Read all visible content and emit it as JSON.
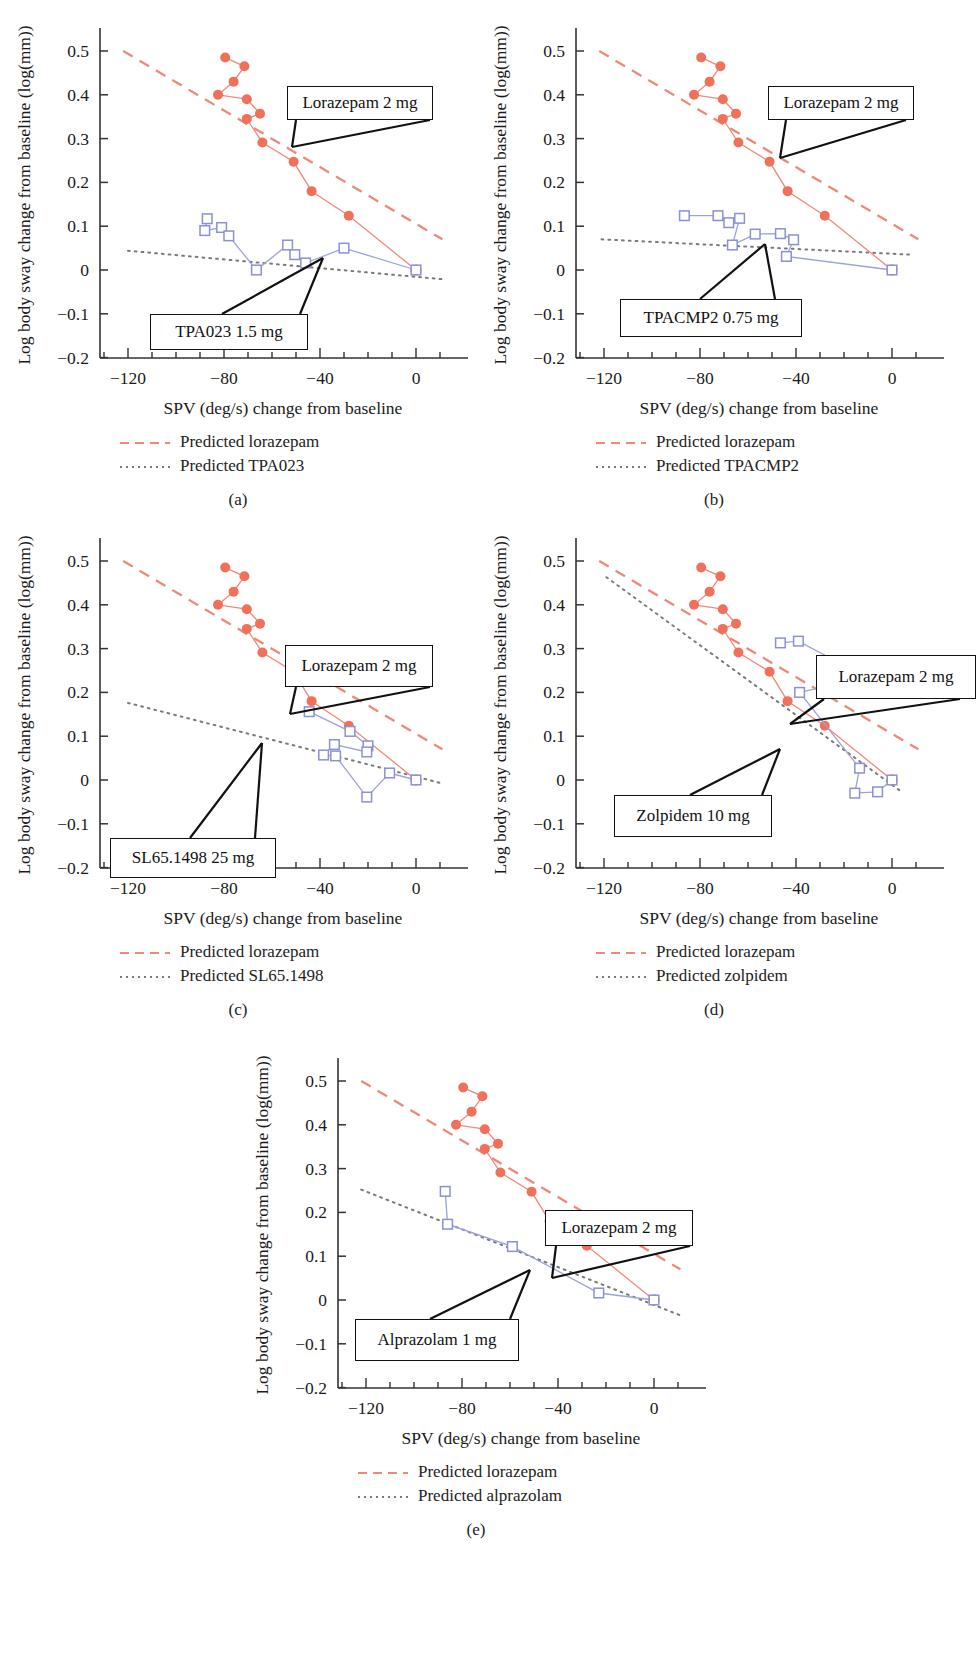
{
  "figure": {
    "x_axis_label": "SPV (deg/s) change from baseline",
    "y_axis_label": "Log body sway change from baseline (log(mm))",
    "x_ticks": [
      "−120",
      "−80",
      "−40",
      "0"
    ],
    "y_ticks": [
      "0.5",
      "0.4",
      "0.3",
      "0.2",
      "0.1",
      "0",
      "−0.1",
      "−0.2"
    ],
    "colors": {
      "lorazepam": "#F0705A",
      "comparator": "#8A92D0",
      "predicted_lorazepam": "#EE8878",
      "predicted_comparator": "#7A7A7A",
      "origin_marker": "#C9615C"
    }
  },
  "panels": [
    {
      "id": "a",
      "caption": "(a)",
      "annotations": [
        {
          "label": "Lorazepam 2 mg"
        },
        {
          "label": "TPA023 1.5 mg"
        }
      ],
      "legend": [
        {
          "style": "dashed",
          "label": "Predicted lorazepam"
        },
        {
          "style": "dotted",
          "label": "Predicted TPA023"
        }
      ]
    },
    {
      "id": "b",
      "caption": "(b)",
      "annotations": [
        {
          "label": "Lorazepam 2 mg"
        },
        {
          "label": "TPACMP2 0.75 mg"
        }
      ],
      "legend": [
        {
          "style": "dashed",
          "label": "Predicted lorazepam"
        },
        {
          "style": "dotted",
          "label": "Predicted TPACMP2"
        }
      ]
    },
    {
      "id": "c",
      "caption": "(c)",
      "annotations": [
        {
          "label": "Lorazepam 2 mg"
        },
        {
          "label": "SL65.1498 25 mg"
        }
      ],
      "legend": [
        {
          "style": "dashed",
          "label": "Predicted lorazepam"
        },
        {
          "style": "dotted",
          "label": "Predicted SL65.1498"
        }
      ]
    },
    {
      "id": "d",
      "caption": "(d)",
      "annotations": [
        {
          "label": "Lorazepam 2 mg"
        },
        {
          "label": "Zolpidem 10 mg"
        }
      ],
      "legend": [
        {
          "style": "dashed",
          "label": "Predicted lorazepam"
        },
        {
          "style": "dotted",
          "label": "Predicted zolpidem"
        }
      ]
    },
    {
      "id": "e",
      "caption": "(e)",
      "annotations": [
        {
          "label": "Lorazepam 2 mg"
        },
        {
          "label": "Alprazolam 1 mg"
        }
      ],
      "legend": [
        {
          "style": "dashed",
          "label": "Predicted lorazepam"
        },
        {
          "style": "dotted",
          "label": "Predicted alprazolam"
        }
      ]
    }
  ],
  "chart_data": [
    {
      "type": "scatter",
      "panel": "a",
      "title": "(a)",
      "xlabel": "SPV (deg/s) change from baseline",
      "ylabel": "Log body sway change from baseline (log(mm))",
      "xlim": [
        -135,
        15
      ],
      "ylim": [
        -0.23,
        0.53
      ],
      "grid": false,
      "legend_position": "below",
      "series": [
        {
          "name": "Lorazepam 2 mg",
          "marker": "filled-circle",
          "color": "#F0705A",
          "points": [
            [
              -79.5,
              0.485
            ],
            [
              -71.5,
              0.465
            ],
            [
              -76.0,
              0.43
            ],
            [
              -82.5,
              0.4
            ],
            [
              -70.5,
              0.39
            ],
            [
              -65.0,
              0.357
            ],
            [
              -70.5,
              0.345
            ],
            [
              -64.0,
              0.291
            ],
            [
              -51.0,
              0.247
            ],
            [
              -43.5,
              0.18
            ],
            [
              -28.0,
              0.124
            ],
            [
              0.0,
              0.0
            ]
          ]
        },
        {
          "name": "TPA023 1.5 mg",
          "marker": "open-square",
          "color": "#8A92D0",
          "points": [
            [
              -87.0,
              0.117
            ],
            [
              -88.0,
              0.09
            ],
            [
              -81.0,
              0.097
            ],
            [
              -78.0,
              0.078
            ],
            [
              -66.5,
              0.0
            ],
            [
              -53.5,
              0.057
            ],
            [
              -50.5,
              0.035
            ],
            [
              -46.0,
              0.016
            ],
            [
              -30.0,
              0.05
            ],
            [
              0.0,
              0.0
            ]
          ]
        },
        {
          "name": "Predicted lorazepam",
          "type": "line",
          "style": "dashed",
          "color": "#EE8878",
          "endpoints": [
            [
              -122.0,
              0.5
            ],
            [
              11.0,
              0.07
            ]
          ]
        },
        {
          "name": "Predicted TPA023",
          "type": "line",
          "style": "dotted",
          "color": "#7A7A7A",
          "endpoints": [
            [
              -120.0,
              0.044
            ],
            [
              11.0,
              -0.021
            ]
          ]
        }
      ]
    },
    {
      "type": "scatter",
      "panel": "b",
      "title": "(b)",
      "xlabel": "SPV (deg/s) change from baseline",
      "ylabel": "Log body sway change from baseline (log(mm))",
      "xlim": [
        -135,
        15
      ],
      "ylim": [
        -0.23,
        0.53
      ],
      "grid": false,
      "legend_position": "below",
      "series": [
        {
          "name": "Lorazepam 2 mg",
          "marker": "filled-circle",
          "color": "#F0705A",
          "points": [
            [
              -79.5,
              0.485
            ],
            [
              -71.5,
              0.465
            ],
            [
              -76.0,
              0.43
            ],
            [
              -82.5,
              0.4
            ],
            [
              -70.5,
              0.39
            ],
            [
              -65.0,
              0.357
            ],
            [
              -70.5,
              0.345
            ],
            [
              -64.0,
              0.291
            ],
            [
              -51.0,
              0.247
            ],
            [
              -43.5,
              0.18
            ],
            [
              -28.0,
              0.124
            ],
            [
              0.0,
              0.0
            ]
          ]
        },
        {
          "name": "TPACMP2 0.75 mg",
          "marker": "open-square",
          "color": "#8A92D0",
          "points": [
            [
              -86.5,
              0.124
            ],
            [
              -72.5,
              0.124
            ],
            [
              -68.0,
              0.108
            ],
            [
              -63.5,
              0.118
            ],
            [
              -66.5,
              0.057
            ],
            [
              -57.0,
              0.082
            ],
            [
              -46.5,
              0.083
            ],
            [
              -41.0,
              0.069
            ],
            [
              -44.0,
              0.031
            ],
            [
              0.0,
              0.0
            ]
          ]
        },
        {
          "name": "Predicted lorazepam",
          "type": "line",
          "style": "dashed",
          "color": "#EE8878",
          "endpoints": [
            [
              -122.0,
              0.5
            ],
            [
              11.0,
              0.07
            ]
          ]
        },
        {
          "name": "Predicted TPACMP2",
          "type": "line",
          "style": "dotted",
          "color": "#7A7A7A",
          "endpoints": [
            [
              -121.0,
              0.07
            ],
            [
              8.0,
              0.035
            ]
          ]
        }
      ]
    },
    {
      "type": "scatter",
      "panel": "c",
      "title": "(c)",
      "xlabel": "SPV (deg/s) change from baseline",
      "ylabel": "Log body sway change from baseline (log(mm))",
      "xlim": [
        -135,
        15
      ],
      "ylim": [
        -0.23,
        0.53
      ],
      "grid": false,
      "legend_position": "below",
      "series": [
        {
          "name": "Lorazepam 2 mg",
          "marker": "filled-circle",
          "color": "#F0705A",
          "points": [
            [
              -79.5,
              0.485
            ],
            [
              -71.5,
              0.465
            ],
            [
              -76.0,
              0.43
            ],
            [
              -82.5,
              0.4
            ],
            [
              -70.5,
              0.39
            ],
            [
              -65.0,
              0.357
            ],
            [
              -70.5,
              0.345
            ],
            [
              -64.0,
              0.291
            ],
            [
              -51.0,
              0.247
            ],
            [
              -43.5,
              0.18
            ],
            [
              -28.0,
              0.124
            ],
            [
              0.0,
              0.0
            ]
          ]
        },
        {
          "name": "SL65.1498 25 mg",
          "marker": "open-square",
          "color": "#8A92D0",
          "points": [
            [
              -44.5,
              0.156
            ],
            [
              -27.5,
              0.111
            ],
            [
              -20.0,
              0.078
            ],
            [
              -20.5,
              0.064
            ],
            [
              -34.0,
              0.081
            ],
            [
              -38.5,
              0.057
            ],
            [
              -33.5,
              0.055
            ],
            [
              -20.5,
              -0.039
            ],
            [
              -11.0,
              0.016
            ],
            [
              0.0,
              0.0
            ]
          ]
        },
        {
          "name": "Predicted lorazepam",
          "type": "line",
          "style": "dashed",
          "color": "#EE8878",
          "endpoints": [
            [
              -122.0,
              0.5
            ],
            [
              11.0,
              0.07
            ]
          ]
        },
        {
          "name": "Predicted SL65.1498",
          "type": "line",
          "style": "dotted",
          "color": "#7A7A7A",
          "endpoints": [
            [
              -120.0,
              0.176
            ],
            [
              11.0,
              -0.008
            ]
          ]
        }
      ]
    },
    {
      "type": "scatter",
      "panel": "d",
      "title": "(d)",
      "xlabel": "SPV (deg/s) change from baseline",
      "ylabel": "Log body sway change from baseline (log(mm))",
      "xlim": [
        -135,
        15
      ],
      "ylim": [
        -0.23,
        0.53
      ],
      "grid": false,
      "legend_position": "below",
      "series": [
        {
          "name": "Lorazepam 2 mg",
          "marker": "filled-circle",
          "color": "#F0705A",
          "points": [
            [
              -79.5,
              0.485
            ],
            [
              -71.5,
              0.465
            ],
            [
              -76.0,
              0.43
            ],
            [
              -82.5,
              0.4
            ],
            [
              -70.5,
              0.39
            ],
            [
              -65.0,
              0.357
            ],
            [
              -70.5,
              0.345
            ],
            [
              -64.0,
              0.291
            ],
            [
              -51.0,
              0.247
            ],
            [
              -43.5,
              0.18
            ],
            [
              -28.0,
              0.124
            ],
            [
              0.0,
              0.0
            ]
          ]
        },
        {
          "name": "Zolpidem 10 mg",
          "marker": "open-square",
          "color": "#8A92D0",
          "points": [
            [
              -46.5,
              0.313
            ],
            [
              -39.0,
              0.317
            ],
            [
              -15.0,
              0.247
            ],
            [
              -21.0,
              0.222
            ],
            [
              -38.5,
              0.2
            ],
            [
              -13.5,
              0.027
            ],
            [
              -15.5,
              -0.03
            ],
            [
              -6.0,
              -0.027
            ],
            [
              0.0,
              0.0
            ]
          ]
        },
        {
          "name": "Predicted lorazepam",
          "type": "line",
          "style": "dashed",
          "color": "#EE8878",
          "endpoints": [
            [
              -122.0,
              0.5
            ],
            [
              11.0,
              0.07
            ]
          ]
        },
        {
          "name": "Predicted zolpidem",
          "type": "line",
          "style": "dotted",
          "color": "#7A7A7A",
          "endpoints": [
            [
              -119.0,
              0.463
            ],
            [
              3.0,
              -0.023
            ]
          ]
        }
      ]
    },
    {
      "type": "scatter",
      "panel": "e",
      "title": "(e)",
      "xlabel": "SPV (deg/s) change from baseline",
      "ylabel": "Log body sway change from baseline (log(mm))",
      "xlim": [
        -135,
        15
      ],
      "ylim": [
        -0.23,
        0.53
      ],
      "grid": false,
      "legend_position": "below",
      "series": [
        {
          "name": "Lorazepam 2 mg",
          "marker": "filled-circle",
          "color": "#F0705A",
          "points": [
            [
              -79.5,
              0.485
            ],
            [
              -71.5,
              0.465
            ],
            [
              -76.0,
              0.43
            ],
            [
              -82.5,
              0.4
            ],
            [
              -70.5,
              0.39
            ],
            [
              -65.0,
              0.357
            ],
            [
              -70.5,
              0.345
            ],
            [
              -64.0,
              0.291
            ],
            [
              -51.0,
              0.247
            ],
            [
              -43.5,
              0.18
            ],
            [
              -28.0,
              0.124
            ],
            [
              0.0,
              0.0
            ]
          ]
        },
        {
          "name": "Alprazolam 1 mg",
          "marker": "open-square",
          "color": "#8A92D0",
          "points": [
            [
              -87.0,
              0.248
            ],
            [
              -86.0,
              0.173
            ],
            [
              -59.0,
              0.122
            ],
            [
              -23.0,
              0.016
            ],
            [
              0.0,
              0.0
            ]
          ]
        },
        {
          "name": "Predicted lorazepam",
          "type": "line",
          "style": "dashed",
          "color": "#EE8878",
          "endpoints": [
            [
              -122.0,
              0.5
            ],
            [
              11.0,
              0.07
            ]
          ]
        },
        {
          "name": "Predicted alprazolam",
          "type": "line",
          "style": "dotted",
          "color": "#7A7A7A",
          "endpoints": [
            [
              -122.0,
              0.252
            ],
            [
              11.0,
              -0.035
            ]
          ]
        }
      ]
    }
  ]
}
